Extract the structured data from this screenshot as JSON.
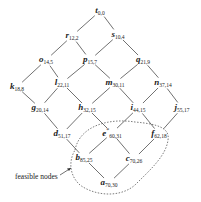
{
  "diagram": {
    "type": "lattice",
    "nodes": [
      {
        "id": "t",
        "letter": "t",
        "sub": "0,0",
        "star": "",
        "x": 100,
        "y": 11
      },
      {
        "id": "r",
        "letter": "r",
        "sub": "12,2",
        "star": "",
        "x": 72,
        "y": 36
      },
      {
        "id": "s",
        "letter": "s",
        "sub": "10,4",
        "star": "",
        "x": 118,
        "y": 35
      },
      {
        "id": "o",
        "letter": "o",
        "sub": "14,5",
        "star": "",
        "x": 46,
        "y": 60
      },
      {
        "id": "p",
        "letter": "p",
        "sub": "15,7",
        "star": "",
        "x": 90,
        "y": 60
      },
      {
        "id": "q",
        "letter": "q",
        "sub": "21,9",
        "star": "",
        "x": 143,
        "y": 60
      },
      {
        "id": "k",
        "letter": "k",
        "sub": "18,8",
        "star": "",
        "x": 17,
        "y": 87
      },
      {
        "id": "l",
        "letter": "l",
        "sub": "22,11",
        "star": "",
        "x": 62,
        "y": 83
      },
      {
        "id": "m",
        "letter": "m",
        "sub": "30,11",
        "star": "",
        "x": 115,
        "y": 83
      },
      {
        "id": "n",
        "letter": "n",
        "sub": "37,14",
        "star": "",
        "x": 163,
        "y": 83
      },
      {
        "id": "g",
        "letter": "g",
        "sub": "20,14",
        "star": "",
        "x": 40,
        "y": 108
      },
      {
        "id": "h",
        "letter": "h",
        "sub": "32,15",
        "star": "",
        "x": 87,
        "y": 108
      },
      {
        "id": "i",
        "letter": "i",
        "sub": "44,15",
        "star": "",
        "x": 138,
        "y": 108
      },
      {
        "id": "j",
        "letter": "j",
        "sub": "55,17",
        "star": "",
        "x": 182,
        "y": 108
      },
      {
        "id": "d",
        "letter": "d",
        "sub": "51,17",
        "star": "",
        "x": 62,
        "y": 134
      },
      {
        "id": "e",
        "letter": "e",
        "sub": "60,31",
        "star": "*",
        "x": 112,
        "y": 133
      },
      {
        "id": "f",
        "letter": "f",
        "sub": "62,18",
        "star": "",
        "x": 159,
        "y": 134
      },
      {
        "id": "b",
        "letter": "b",
        "sub": "85,25",
        "star": "",
        "x": 84,
        "y": 158
      },
      {
        "id": "c",
        "letter": "c",
        "sub": "70,26",
        "star": "",
        "x": 134,
        "y": 159
      },
      {
        "id": "a",
        "letter": "a",
        "sub": "70,30",
        "star": "",
        "x": 109,
        "y": 183
      }
    ],
    "edges": [
      [
        "t",
        "r"
      ],
      [
        "t",
        "s"
      ],
      [
        "r",
        "o"
      ],
      [
        "r",
        "p"
      ],
      [
        "s",
        "p"
      ],
      [
        "s",
        "q"
      ],
      [
        "o",
        "k"
      ],
      [
        "o",
        "l"
      ],
      [
        "p",
        "l"
      ],
      [
        "p",
        "m"
      ],
      [
        "q",
        "m"
      ],
      [
        "q",
        "n"
      ],
      [
        "k",
        "g"
      ],
      [
        "l",
        "g"
      ],
      [
        "l",
        "h"
      ],
      [
        "m",
        "h"
      ],
      [
        "m",
        "i"
      ],
      [
        "n",
        "i"
      ],
      [
        "n",
        "j"
      ],
      [
        "g",
        "d"
      ],
      [
        "h",
        "d"
      ],
      [
        "h",
        "e"
      ],
      [
        "i",
        "e"
      ],
      [
        "i",
        "f"
      ],
      [
        "j",
        "f"
      ],
      [
        "d",
        "b"
      ],
      [
        "e",
        "b"
      ],
      [
        "e",
        "c"
      ],
      [
        "f",
        "c"
      ],
      [
        "b",
        "a"
      ],
      [
        "c",
        "a"
      ]
    ],
    "feasible_region": {
      "label": "feasible nodes",
      "members": [
        "e",
        "f",
        "b",
        "c",
        "a"
      ]
    }
  },
  "caption": {
    "text": "feasible nodes"
  }
}
